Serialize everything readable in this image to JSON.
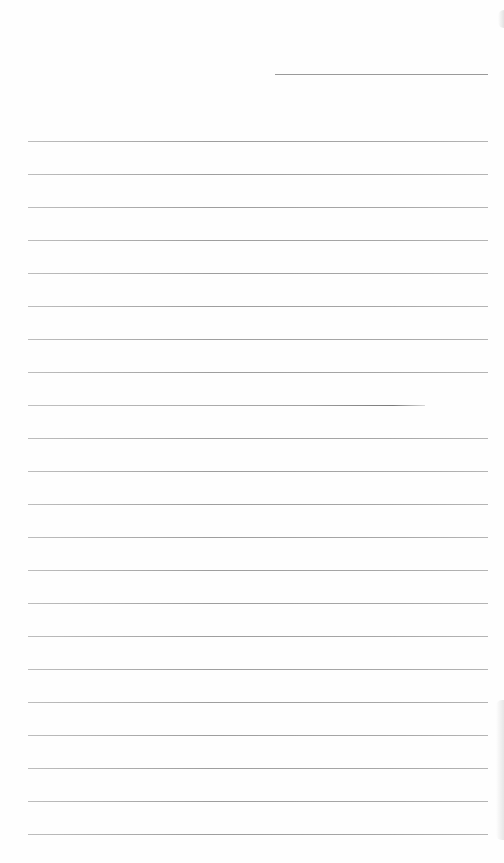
{
  "page": {
    "type": "lined-paper",
    "background": "#ffffff",
    "line_color": "#a0a0a0",
    "header_line": {
      "x": 275,
      "y": 74,
      "width": 213
    },
    "rules": {
      "start_y": 141,
      "spacing": 33,
      "count": 22,
      "x": 28,
      "width": 460,
      "short_rule_index": 8,
      "short_rule_width": 397
    },
    "text": []
  }
}
